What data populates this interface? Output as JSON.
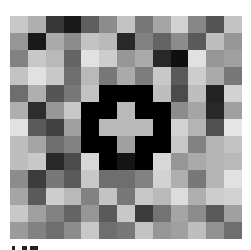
{
  "image": {
    "description": "13x13 grid of grayscale squares with a black octagon ring enclosing a light gray plus sign",
    "grid": {
      "rows": 13,
      "cols": 13,
      "gray_values": [
        [
          200,
          175,
          55,
          25,
          95,
          140,
          195,
          120,
          165,
          210,
          135,
          85,
          195
        ],
        [
          150,
          25,
          170,
          140,
          195,
          185,
          40,
          130,
          100,
          140,
          90,
          190,
          150
        ],
        [
          130,
          200,
          185,
          100,
          225,
          205,
          150,
          170,
          40,
          15,
          225,
          150,
          160
        ],
        [
          195,
          225,
          200,
          110,
          185,
          120,
          170,
          125,
          200,
          90,
          205,
          170,
          120
        ],
        [
          110,
          175,
          85,
          120,
          195,
          0,
          0,
          0,
          190,
          75,
          190,
          35,
          210
        ],
        [
          175,
          45,
          150,
          200,
          0,
          0,
          185,
          0,
          0,
          140,
          165,
          40,
          160
        ],
        [
          225,
          90,
          65,
          160,
          0,
          185,
          185,
          185,
          0,
          210,
          180,
          80,
          230
        ],
        [
          190,
          165,
          110,
          130,
          0,
          0,
          160,
          0,
          0,
          200,
          130,
          180,
          195
        ],
        [
          190,
          200,
          40,
          75,
          215,
          0,
          20,
          0,
          215,
          150,
          170,
          180,
          185
        ],
        [
          140,
          60,
          120,
          90,
          200,
          110,
          110,
          130,
          210,
          175,
          120,
          180,
          225
        ],
        [
          165,
          90,
          205,
          185,
          130,
          195,
          120,
          200,
          185,
          220,
          175,
          205,
          210
        ],
        [
          200,
          160,
          130,
          100,
          150,
          90,
          200,
          60,
          115,
          165,
          140,
          90,
          160
        ],
        [
          155,
          130,
          110,
          140,
          200,
          110,
          120,
          195,
          150,
          160,
          190,
          145,
          110
        ]
      ]
    },
    "center_symbol": {
      "shape": "octagon-ring-with-plus",
      "ring_color": "#000000",
      "plus_color": "#b9b9b9",
      "rows": [
        4,
        8
      ],
      "cols": [
        4,
        8
      ]
    },
    "caption_fragment": {
      "note": "illegible clipped text at bottom edge",
      "segments": [
        {
          "left": 0,
          "width": 3
        },
        {
          "left": 10,
          "width": 5
        },
        {
          "left": 18,
          "width": 8
        }
      ]
    }
  }
}
